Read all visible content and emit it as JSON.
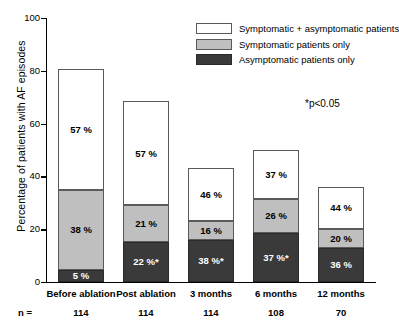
{
  "chart_data": {
    "type": "bar",
    "subtype": "stacked-bar",
    "title": "",
    "xlabel": "",
    "ylabel": "Percentage of patients with AF episodes",
    "ylim": [
      0,
      100
    ],
    "yticks": [
      0,
      20,
      40,
      60,
      80,
      100
    ],
    "grid": false,
    "legend_position": "top-right",
    "categories": [
      "Before ablation",
      "Post ablation",
      "3 months",
      "6 months",
      "12 months"
    ],
    "sample_sizes": [
      "114",
      "114",
      "114",
      "108",
      "70"
    ],
    "sample_size_prefix": "n =",
    "annotation": "*p<0.05",
    "bar_totals": [
      80.5,
      68.5,
      43.0,
      50.0,
      36.0
    ],
    "series": [
      {
        "name": "Asymptomatic patients only",
        "color": "#3a3a3a",
        "segment_heights": [
          4.5,
          15.0,
          16.0,
          18.5,
          13.0
        ],
        "labels": [
          "5 %",
          "22 %*",
          "38 %*",
          "37 %*",
          "36 %"
        ],
        "values": [
          5,
          22,
          38,
          37,
          36
        ],
        "significant": [
          false,
          true,
          true,
          true,
          false
        ]
      },
      {
        "name": "Symptomatic patients only",
        "color": "#bfbfbf",
        "segment_heights": [
          30.5,
          14.0,
          7.0,
          13.0,
          7.0
        ],
        "labels": [
          "38 %",
          "21 %",
          "16 %",
          "26 %",
          "20 %"
        ],
        "values": [
          38,
          21,
          16,
          26,
          20
        ],
        "significant": [
          false,
          false,
          false,
          false,
          false
        ]
      },
      {
        "name": "Symptomatic + asymptomatic patients",
        "color": "#ffffff",
        "segment_heights": [
          45.5,
          39.5,
          20.0,
          18.5,
          16.0
        ],
        "labels": [
          "57 %",
          "57 %",
          "46 %",
          "37 %",
          "44 %"
        ],
        "values": [
          57,
          57,
          46,
          37,
          44
        ],
        "significant": [
          false,
          false,
          false,
          false,
          false
        ]
      }
    ],
    "legend": [
      {
        "label": "Symptomatic + asymptomatic patients",
        "swatch": "white"
      },
      {
        "label": "Symptomatic patients only",
        "swatch": "gray"
      },
      {
        "label": "Asymptomatic patients only",
        "swatch": "dark"
      }
    ]
  }
}
